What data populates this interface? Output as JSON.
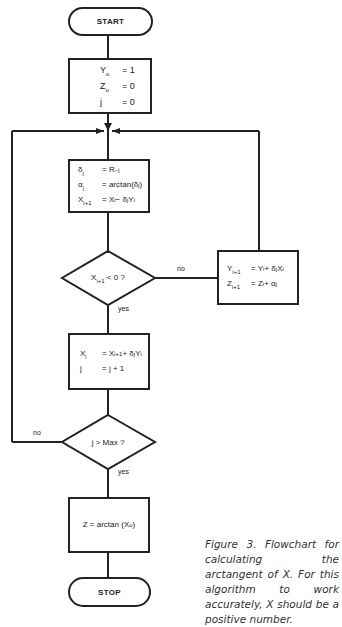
{
  "flowchart": {
    "start": {
      "label": "START"
    },
    "init": {
      "lines": [
        {
          "lhs": "Y",
          "lhs_sub": "o",
          "rhs": "= 1"
        },
        {
          "lhs": "Z",
          "lhs_sub": "o",
          "rhs": "= 0"
        },
        {
          "lhs": "j",
          "lhs_sub": "",
          "rhs": "= 0"
        }
      ]
    },
    "step": {
      "lines": [
        {
          "lhs": "δ",
          "lhs_sub": "j",
          "rhs": "= R",
          "rhs_sup": "−j"
        },
        {
          "lhs": "α",
          "lhs_sub": "j",
          "rhs": "= arctan(δ",
          "rhs_sub": "j",
          "rhs_tail": ")"
        },
        {
          "lhs": "X",
          "lhs_sub": "i+1",
          "rhs": "= X",
          "rhs_sub": "i",
          "rhs_tail": " − δ",
          "rhs_sub2": "j",
          "rhs_tail2": "Y",
          "rhs_sub3": "i"
        }
      ]
    },
    "decision1": {
      "text": "X",
      "text_sub": "i+1",
      "text_tail": " < 0 ?",
      "no_label": "no",
      "yes_label": "yes"
    },
    "update_yz": {
      "lines": [
        {
          "lhs": "Y",
          "lhs_sub": "i+1",
          "rhs": "= Y",
          "rhs_sub": "i",
          "rhs_tail": " + δ",
          "rhs_sub2": "j",
          "rhs_tail2": "X",
          "rhs_sub3": "i"
        },
        {
          "lhs": "Z",
          "lhs_sub": "i+1",
          "rhs": "= Z",
          "rhs_sub": "i",
          "rhs_tail": " + α",
          "rhs_sub2": "j",
          "rhs_tail2": "",
          "rhs_sub3": ""
        }
      ]
    },
    "update_x": {
      "lines": [
        {
          "lhs": "X",
          "lhs_sub": "i",
          "rhs": "= X",
          "rhs_sub": "i+1",
          "rhs_tail": " + δ",
          "rhs_sub2": "j",
          "rhs_tail2": "Y",
          "rhs_sub3": "i"
        },
        {
          "lhs": "j",
          "lhs_sub": "",
          "rhs": "= j + 1",
          "rhs_sub": "",
          "rhs_tail": "",
          "rhs_sub2": "",
          "rhs_tail2": "",
          "rhs_sub3": ""
        }
      ]
    },
    "decision2": {
      "text": "j > Max ?",
      "no_label": "no",
      "yes_label": "yes"
    },
    "result": {
      "text": "Z = arctan (X",
      "text_sub": "o",
      "text_tail": ")"
    },
    "stop": {
      "label": "STOP"
    }
  },
  "caption": "Figure 3. Flowchart for calculating the arctangent of X. For this algorithm to work accurately, X should be a positive number."
}
